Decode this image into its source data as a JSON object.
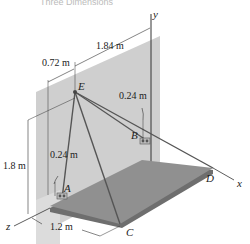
{
  "header": {
    "title": "Three Dimensions"
  },
  "figure": {
    "axes": {
      "x": "x",
      "y": "y",
      "z": "z"
    },
    "points": {
      "A": "A",
      "B": "B",
      "C": "C",
      "D": "D",
      "E": "E"
    },
    "dimensions": {
      "top_span": "1.84 m",
      "e_offset": "0.72 m",
      "b_offset": "0.24 m",
      "a_offset": "0.24 m",
      "height": "1.8 m",
      "width": "1.2 m"
    },
    "colors": {
      "wall": "#c8c8c8",
      "wall_shadow": "#d8d8d8",
      "plate_top": "#8c8c8c",
      "plate_edge": "#6a6a6a",
      "cable": "#555555"
    }
  }
}
